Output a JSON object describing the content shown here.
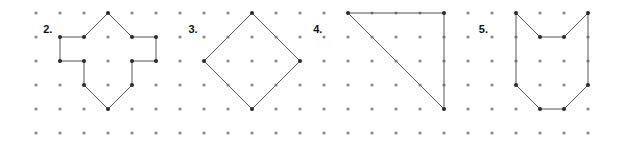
{
  "worksheet": {
    "title": "Geoboard Shapes",
    "width": 624,
    "height": 147,
    "background_color": "#ffffff"
  },
  "grid": {
    "origin_x": 36,
    "origin_y": 13,
    "spacing_x": 24,
    "spacing_y": 24,
    "columns": 24,
    "rows": 6,
    "dot_radius": 1.6,
    "dot_color": "#8a8a8a"
  },
  "style": {
    "stroke_color": "#555555",
    "stroke_width": 1,
    "vertex_color": "#2b2b2b",
    "vertex_radius": 2,
    "label_color": "#111111"
  },
  "problems": [
    {
      "label": "2.",
      "name": "shape-2-hexagon-with-notches",
      "label_col": 0.55,
      "label_row": 0.72,
      "closed": true,
      "vertices": [
        {
          "col": 3,
          "row": 0
        },
        {
          "col": 4,
          "row": 1
        },
        {
          "col": 5,
          "row": 1
        },
        {
          "col": 5,
          "row": 2
        },
        {
          "col": 4,
          "row": 2
        },
        {
          "col": 4,
          "row": 3
        },
        {
          "col": 3,
          "row": 4
        },
        {
          "col": 2,
          "row": 3
        },
        {
          "col": 2,
          "row": 2
        },
        {
          "col": 1,
          "row": 2
        },
        {
          "col": 1,
          "row": 1
        },
        {
          "col": 2,
          "row": 1
        }
      ]
    },
    {
      "label": "3.",
      "name": "shape-3-diamond",
      "label_col": 6.6,
      "label_row": 0.72,
      "closed": true,
      "vertices": [
        {
          "col": 9,
          "row": 0
        },
        {
          "col": 11,
          "row": 2
        },
        {
          "col": 9,
          "row": 4
        },
        {
          "col": 7,
          "row": 2
        }
      ]
    },
    {
      "label": "4.",
      "name": "shape-4-right-triangle",
      "label_col": 11.8,
      "label_row": 0.72,
      "closed": true,
      "vertices": [
        {
          "col": 13,
          "row": 0
        },
        {
          "col": 17,
          "row": 0
        },
        {
          "col": 17,
          "row": 4
        }
      ]
    },
    {
      "label": "5.",
      "name": "shape-5-notched-polygon",
      "label_col": 18.7,
      "label_row": 0.72,
      "closed": true,
      "vertices": [
        {
          "col": 20,
          "row": 0
        },
        {
          "col": 21,
          "row": 1
        },
        {
          "col": 22,
          "row": 1
        },
        {
          "col": 23,
          "row": 0
        },
        {
          "col": 23,
          "row": 3
        },
        {
          "col": 22,
          "row": 4
        },
        {
          "col": 21,
          "row": 4
        },
        {
          "col": 20,
          "row": 3
        }
      ]
    }
  ]
}
